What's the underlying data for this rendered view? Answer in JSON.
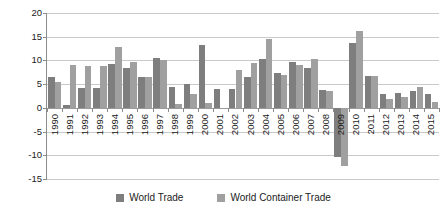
{
  "chart_data": {
    "type": "bar",
    "title": "",
    "subtitle": "",
    "xlabel": "",
    "ylabel": "",
    "ylim": [
      -15,
      20
    ],
    "yticks": [
      20,
      15,
      10,
      5,
      0,
      -5,
      -10,
      -15
    ],
    "ytick_labels": [
      "20",
      "15",
      "10",
      "5",
      "0",
      "-5",
      "-10",
      "-15"
    ],
    "grid": true,
    "legend_position": "bottom",
    "categories": [
      "1990",
      "1991",
      "1992",
      "1993",
      "1994",
      "1995",
      "1996",
      "1997",
      "1998",
      "1999",
      "2000",
      "2001",
      "2002",
      "2003",
      "2004",
      "2005",
      "2006",
      "2007",
      "2008",
      "2009",
      "2010",
      "2011",
      "2012",
      "2013",
      "2014",
      "2015"
    ],
    "series": [
      {
        "name": "World Trade",
        "color": "#7e7e7e",
        "values": [
          6.6,
          0.6,
          4.2,
          4.2,
          9.3,
          8.5,
          6.5,
          10.5,
          4.4,
          5.0,
          13.2,
          4.0,
          3.9,
          6.5,
          10.2,
          7.4,
          9.6,
          8.5,
          3.7,
          -10.3,
          13.6,
          6.8,
          2.9,
          3.2,
          3.5,
          2.9
        ]
      },
      {
        "name": "World Container Trade",
        "color": "#a0a0a0",
        "values": [
          5.4,
          9.0,
          8.9,
          8.8,
          12.9,
          9.7,
          6.5,
          10.1,
          0.9,
          2.9,
          1.0,
          0.0,
          7.9,
          9.5,
          14.5,
          7.0,
          9.0,
          10.3,
          3.6,
          -12.3,
          16.3,
          6.8,
          1.9,
          2.2,
          4.4,
          1.2
        ]
      }
    ]
  },
  "legend": {
    "entries": [
      {
        "label": "World Trade",
        "color": "#7e7e7e"
      },
      {
        "label": "World Container Trade",
        "color": "#a0a0a0"
      }
    ]
  }
}
